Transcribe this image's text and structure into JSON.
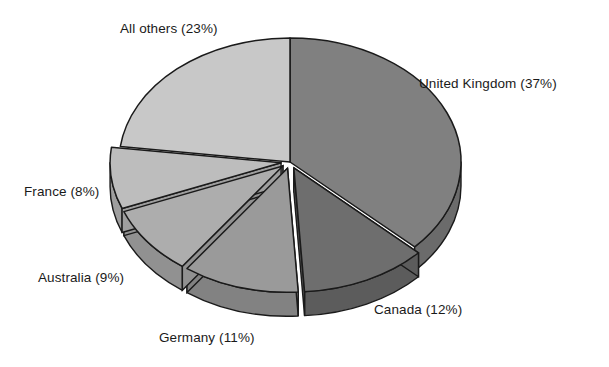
{
  "chart_data": {
    "type": "pie",
    "title": "",
    "subtitle": "",
    "xlabel": "",
    "ylabel": "",
    "legend_position": "none",
    "grid": false,
    "style": "3d-exploded-grayscale",
    "start_angle_deg": 0,
    "direction": "clockwise",
    "categories": [
      "United Kingdom",
      "Canada",
      "Germany",
      "Australia",
      "France",
      "All others"
    ],
    "values": [
      37,
      12,
      11,
      9,
      8,
      23
    ],
    "units": "%",
    "labels": [
      "United Kingdom (37%)",
      "Canada (12%)",
      "Germany (11%)",
      "Australia (9%)",
      "France (8%)",
      "All others (23%)"
    ],
    "slices": [
      {
        "name": "United Kingdom",
        "value": 37,
        "label": "United Kingdom (37%)",
        "color": "#808080",
        "side_color": "#6b6b6b",
        "start_deg": 0.0,
        "end_deg": 133.2,
        "exploded": false
      },
      {
        "name": "Canada",
        "value": 12,
        "label": "Canada (12%)",
        "color": "#6e6e6e",
        "side_color": "#5c5c5c",
        "start_deg": 133.2,
        "end_deg": 176.4,
        "exploded": true
      },
      {
        "name": "Germany",
        "value": 11,
        "label": "Germany (11%)",
        "color": "#9a9a9a",
        "side_color": "#828282",
        "start_deg": 176.4,
        "end_deg": 216.0,
        "exploded": true
      },
      {
        "name": "Australia",
        "value": 9,
        "label": "Australia (9%)",
        "color": "#adadad",
        "side_color": "#919191",
        "start_deg": 216.0,
        "end_deg": 248.4,
        "exploded": true
      },
      {
        "name": "France",
        "value": 8,
        "label": "France (8%)",
        "color": "#bdbdbd",
        "side_color": "#9e9e9e",
        "start_deg": 248.4,
        "end_deg": 277.2,
        "exploded": true
      },
      {
        "name": "All others",
        "value": 23,
        "label": "All others (23%)",
        "color": "#c8c8c8",
        "side_color": "#a8a8a8",
        "start_deg": 277.2,
        "end_deg": 360.0,
        "exploded": false
      }
    ],
    "colors": [
      "#808080",
      "#6e6e6e",
      "#9a9a9a",
      "#adadad",
      "#bdbdbd",
      "#c8c8c8"
    ],
    "background_color": "#ffffff",
    "outline_color": "#1a1a1a"
  },
  "geometry": {
    "cx": 290,
    "cy": 162,
    "rx": 171,
    "ry": 124,
    "depth": 24
  }
}
